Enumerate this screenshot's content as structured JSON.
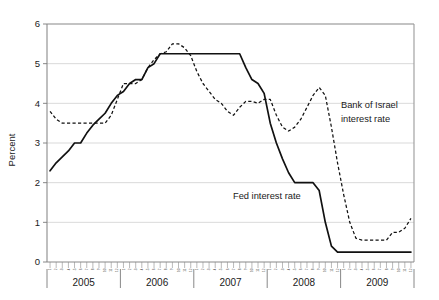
{
  "chart_data": {
    "type": "line",
    "title": "",
    "xlabel": "",
    "ylabel": "Percent",
    "ylim": [
      0,
      6
    ],
    "yticks": [
      0,
      1,
      2,
      3,
      4,
      5,
      6
    ],
    "ytick_labels": [
      "0",
      "1",
      "2",
      "3",
      "4",
      "5",
      "6"
    ],
    "grid": true,
    "grid_axis": "y",
    "legend_position": "inline-annotations",
    "x_major_labels": [
      "2005",
      "2006",
      "2007",
      "2008",
      "2009"
    ],
    "x_minor_labels": [
      "1",
      "2",
      "3",
      "4",
      "5",
      "6",
      "7",
      "8",
      "9",
      "10",
      "11",
      "12"
    ],
    "x_units": "month",
    "x_range": [
      "2005-01",
      "2009-12"
    ],
    "annotations": [
      {
        "name": "bank-of-israel-label",
        "text_line1": "Bank of Israel",
        "text_line2": "interest rate",
        "series": "Bank of Israel interest rate"
      },
      {
        "name": "fed-label",
        "text_line1": "Fed interest rate",
        "text_line2": "",
        "series": "Fed interest rate"
      }
    ],
    "series": [
      {
        "name": "Fed interest rate",
        "style": "solid",
        "color": "#111111",
        "x": [
          "2005-01",
          "2005-02",
          "2005-03",
          "2005-04",
          "2005-05",
          "2005-06",
          "2005-07",
          "2005-08",
          "2005-09",
          "2005-10",
          "2005-11",
          "2005-12",
          "2006-01",
          "2006-02",
          "2006-03",
          "2006-04",
          "2006-05",
          "2006-06",
          "2006-07",
          "2006-08",
          "2006-09",
          "2006-10",
          "2006-11",
          "2006-12",
          "2007-01",
          "2007-02",
          "2007-03",
          "2007-04",
          "2007-05",
          "2007-06",
          "2007-07",
          "2007-08",
          "2007-09",
          "2007-10",
          "2007-11",
          "2007-12",
          "2008-01",
          "2008-02",
          "2008-03",
          "2008-04",
          "2008-05",
          "2008-06",
          "2008-07",
          "2008-08",
          "2008-09",
          "2008-10",
          "2008-11",
          "2008-12",
          "2009-01",
          "2009-02",
          "2009-03",
          "2009-04",
          "2009-05",
          "2009-06",
          "2009-07",
          "2009-08",
          "2009-09",
          "2009-10",
          "2009-11",
          "2009-12"
        ],
        "values": [
          2.3,
          2.5,
          2.65,
          2.8,
          3.0,
          3.0,
          3.25,
          3.45,
          3.6,
          3.75,
          4.0,
          4.2,
          4.3,
          4.5,
          4.6,
          4.6,
          4.9,
          5.0,
          5.25,
          5.25,
          5.25,
          5.25,
          5.25,
          5.25,
          5.25,
          5.25,
          5.25,
          5.25,
          5.25,
          5.25,
          5.25,
          5.25,
          4.9,
          4.6,
          4.5,
          4.25,
          3.5,
          3.0,
          2.6,
          2.25,
          2.0,
          2.0,
          2.0,
          2.0,
          1.8,
          1.0,
          0.4,
          0.25,
          0.25,
          0.25,
          0.25,
          0.25,
          0.25,
          0.25,
          0.25,
          0.25,
          0.25,
          0.25,
          0.25,
          0.25
        ]
      },
      {
        "name": "Bank of Israel interest rate",
        "style": "dashed",
        "color": "#111111",
        "x": [
          "2005-01",
          "2005-02",
          "2005-03",
          "2005-04",
          "2005-05",
          "2005-06",
          "2005-07",
          "2005-08",
          "2005-09",
          "2005-10",
          "2005-11",
          "2005-12",
          "2006-01",
          "2006-02",
          "2006-03",
          "2006-04",
          "2006-05",
          "2006-06",
          "2006-07",
          "2006-08",
          "2006-09",
          "2006-10",
          "2006-11",
          "2006-12",
          "2007-01",
          "2007-02",
          "2007-03",
          "2007-04",
          "2007-05",
          "2007-06",
          "2007-07",
          "2007-08",
          "2007-09",
          "2007-10",
          "2007-11",
          "2007-12",
          "2008-01",
          "2008-02",
          "2008-03",
          "2008-04",
          "2008-05",
          "2008-06",
          "2008-07",
          "2008-08",
          "2008-09",
          "2008-10",
          "2008-11",
          "2008-12",
          "2009-01",
          "2009-02",
          "2009-03",
          "2009-04",
          "2009-05",
          "2009-06",
          "2009-07",
          "2009-08",
          "2009-09",
          "2009-10",
          "2009-11",
          "2009-12"
        ],
        "values": [
          3.8,
          3.6,
          3.5,
          3.5,
          3.5,
          3.5,
          3.5,
          3.5,
          3.5,
          3.5,
          3.7,
          4.1,
          4.5,
          4.5,
          4.5,
          4.6,
          4.9,
          5.1,
          5.25,
          5.3,
          5.5,
          5.5,
          5.4,
          5.2,
          4.8,
          4.5,
          4.3,
          4.1,
          4.0,
          3.8,
          3.7,
          3.9,
          4.05,
          4.05,
          4.0,
          4.1,
          4.1,
          3.7,
          3.4,
          3.3,
          3.4,
          3.6,
          3.9,
          4.2,
          4.4,
          4.2,
          3.4,
          2.5,
          1.7,
          1.0,
          0.6,
          0.55,
          0.55,
          0.55,
          0.55,
          0.55,
          0.75,
          0.75,
          0.85,
          1.1
        ]
      }
    ]
  }
}
